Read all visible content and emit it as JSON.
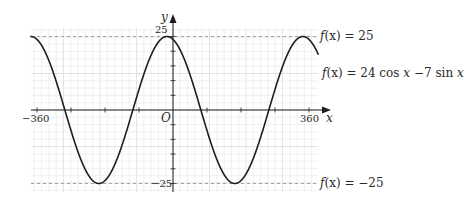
{
  "chart_data": {
    "type": "line",
    "title": "",
    "xlabel": "x",
    "ylabel": "y",
    "xlim": [
      -378,
      385
    ],
    "ylim": [
      -27,
      28
    ],
    "x_ticks": [
      -360,
      360
    ],
    "y_ticks": [
      25,
      -25
    ],
    "origin_label": "O",
    "grid": true,
    "series": [
      {
        "name": "f(x) = 24 cos x − 7 sin x",
        "function": "24*cos(x) - 7*sin(x)",
        "amplitude": 25,
        "phase_deg": 16.26,
        "x_range": [
          -378,
          385
        ],
        "max_points": [
          [
            -16.26,
            25
          ],
          [
            343.74,
            25
          ]
        ],
        "min_points": [
          [
            -196.26,
            -25
          ],
          [
            163.74,
            -25
          ]
        ],
        "zeros": [
          -286.26,
          -106.26,
          73.74,
          253.74
        ]
      }
    ],
    "reference_lines": [
      {
        "y": 25,
        "style": "dashed",
        "label": "f(x) = 25"
      },
      {
        "y": -25,
        "style": "dashed",
        "label": "f(x) = −25"
      }
    ],
    "annotations": [
      {
        "text": "f(x) = 25"
      },
      {
        "text": "f(x) = 24 cos x −7 sin x"
      },
      {
        "text": "f(x) = −25"
      }
    ]
  },
  "labels": {
    "y_axis": "y",
    "x_axis": "x",
    "origin": "O",
    "tick_pos_25": "25",
    "tick_neg_25": "−25",
    "tick_neg_360": "−360",
    "tick_pos_360": "360",
    "annot_max_fx": "f",
    "annot_max_rest": "(x) = 25",
    "annot_func_fx": "f",
    "annot_func_rest": "(x) = 24 cos ",
    "annot_func_x1": "x",
    "annot_func_mid": " −7 sin ",
    "annot_func_x2": "x",
    "annot_min_fx": "f",
    "annot_min_rest": "(x) = −25"
  },
  "colors": {
    "curve": "#1e1e1e",
    "axis": "#1e1e1e",
    "grid_minor": "#ececec",
    "grid_major": "#dcdcdc",
    "dashed": "#9a9a9a"
  }
}
